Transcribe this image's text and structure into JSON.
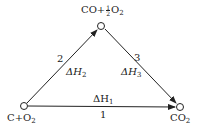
{
  "diagram": {
    "nodes": {
      "start": {
        "text": "C+O",
        "sub": "2"
      },
      "middle": {
        "text_a": "CO+",
        "frac_num": "1",
        "frac_den": "2",
        "text_b": "O",
        "sub": "2"
      },
      "end": {
        "text": "CO",
        "sub": "2"
      }
    },
    "edges": {
      "path1": {
        "number": "1",
        "delta": "ΔH",
        "sub": "1"
      },
      "path2": {
        "number": "2",
        "delta": "ΔH",
        "sub": "2"
      },
      "path3": {
        "number": "3",
        "delta": "ΔH",
        "sub": "3"
      }
    },
    "colors": {
      "stroke": "#222222",
      "background": "#ffffff"
    }
  }
}
